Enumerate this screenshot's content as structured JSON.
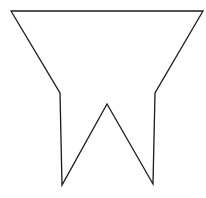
{
  "figure": {
    "width": 206,
    "height": 198,
    "background": "#ffffff",
    "shape": {
      "name": "pennant-polygon",
      "stroke": "#1a1a1a",
      "stroke_width": 1.3,
      "fill": "#ffffff",
      "points": [
        [
          11,
          11
        ],
        [
          203,
          11
        ],
        [
          155,
          93
        ],
        [
          153,
          184
        ],
        [
          107,
          104
        ],
        [
          62,
          185
        ],
        [
          60,
          93
        ]
      ]
    }
  }
}
